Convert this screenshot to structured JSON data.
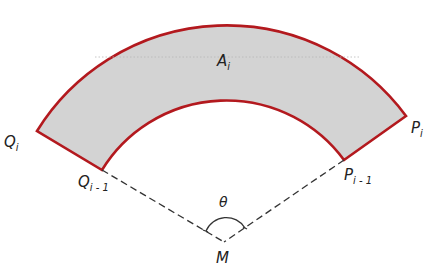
{
  "diagram": {
    "colors": {
      "fill": "#d3d3d3",
      "outline": "#b3191e",
      "dashed": "#333333",
      "text": "#222222",
      "background": "#ffffff"
    },
    "center": {
      "name": "M",
      "x": 224,
      "y": 242
    },
    "outer_radius": 223,
    "inner_radius": 146,
    "labels": {
      "area": {
        "main": "A",
        "sub": "i"
      },
      "Q_i": {
        "main": "Q",
        "sub": "i"
      },
      "Q_i_minus_1": {
        "main": "Q",
        "sub": "i - 1"
      },
      "P_i": {
        "main": "P",
        "sub": "i"
      },
      "P_i_minus_1": {
        "main": "P",
        "sub": "i - 1"
      },
      "center": "M",
      "angle": "θ"
    }
  }
}
